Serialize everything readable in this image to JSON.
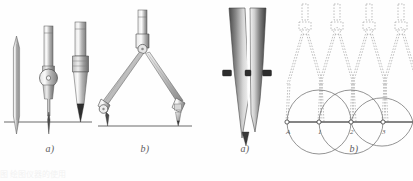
{
  "document": {
    "background_color": "#fefefe",
    "ink_color": "#3a3a3a",
    "caption_color": "#5d5d5d"
  },
  "figures": [
    {
      "id": "compass-attachments-figure",
      "panels": [
        {
          "label": "a)",
          "name": "compass-attachment-parts-panel",
          "description": "Three interchangeable compass attachments standing on a baseline: needle point, pen nib attachment with hinge wheel, and lead/pencil holder",
          "parts": [
            "needle-point-attachment",
            "pen-nib-attachment",
            "lead-holder-attachment"
          ]
        },
        {
          "label": "b)",
          "name": "assembled-compass-panel",
          "description": "Fully assembled drafting compass with extension bar, pivot head, two hinged legs, needle point leg and pen leg resting on a baseline",
          "parts": [
            "extension-bar",
            "pivot-head",
            "left-leg",
            "right-leg",
            "needle-point-leg",
            "pen-leg"
          ]
        }
      ]
    },
    {
      "id": "ruling-pen-and-stepoff-figure",
      "panels": [
        {
          "label": "a)",
          "name": "ruling-pen-nib-panel",
          "description": "Close-up of a ruling pen nib: two shaded blades with adjusting screw collars, tapering to a fine point",
          "parts": [
            "left-blade",
            "right-blade",
            "adjusting-screw-left",
            "adjusting-screw-right",
            "nib-tip"
          ]
        },
        {
          "label": "b)",
          "name": "stepoff-arc-construction-panel",
          "description": "Step-off construction: four dashed compass outlines swinging equal arcs alternately above and below a horizontal baseline",
          "baseline_points": [
            "A",
            "1",
            "2",
            "3"
          ],
          "compass_positions": 4,
          "arc_count": 4,
          "parts": [
            "baseline",
            "compass-ghost-outline",
            "arc-above",
            "arc-below",
            "station-point"
          ]
        }
      ]
    }
  ],
  "bottom_clipped_text": "图   绘图仪器的使用"
}
